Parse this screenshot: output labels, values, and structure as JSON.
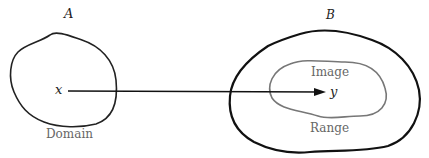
{
  "diagram": {
    "type": "function-mapping",
    "set_a": {
      "label": "A",
      "caption": "Domain",
      "element": "x"
    },
    "set_b": {
      "label": "B",
      "inner_region_label": "Image",
      "inner_region_caption": "Range",
      "element": "y"
    },
    "arrow": {
      "from": "x",
      "to": "y"
    },
    "colors": {
      "outer_stroke": "#111111",
      "inner_stroke": "#777777",
      "text_gray": "#666666"
    }
  }
}
